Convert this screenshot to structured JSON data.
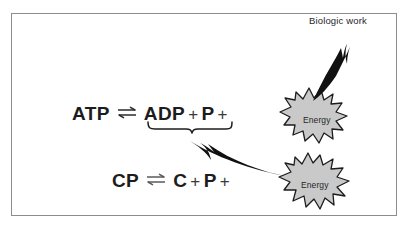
{
  "figure": {
    "kind": "biochemistry-energy-transfer-diagram",
    "border_color": "#8d8d8d",
    "background_color": "#ffffff",
    "ink_color": "#1c1c1c"
  },
  "equations": {
    "atp": {
      "name": "atp-hydrolysis",
      "reactant": "ATP",
      "equilibrium_symbol": "⇌",
      "products": [
        "ADP",
        "P"
      ],
      "plus_signs": [
        "+",
        "+"
      ],
      "trailing_plus": "+",
      "energy_term": "Energy"
    },
    "cp": {
      "name": "creatine-phosphate-breakdown",
      "reactant": "CP",
      "equilibrium_symbol": "⇌",
      "products": [
        "C",
        "P"
      ],
      "plus_signs": [
        "+",
        "+"
      ],
      "trailing_plus": "+",
      "energy_term": "Energy"
    }
  },
  "bursts": [
    {
      "id": "energy-upper",
      "label": "Energy",
      "fill": "#c9c9c9",
      "stroke": "#1c1c1c"
    },
    {
      "id": "energy-lower",
      "label": "Energy",
      "fill": "#c9c9c9",
      "stroke": "#1c1c1c"
    }
  ],
  "annotations": {
    "biologic_work": "Biologic work",
    "brace_spans": "ADP + P",
    "arrow_up_meaning": "energy released to biologic work",
    "arrow_left_meaning": "CP energy resynthesizes ATP"
  }
}
